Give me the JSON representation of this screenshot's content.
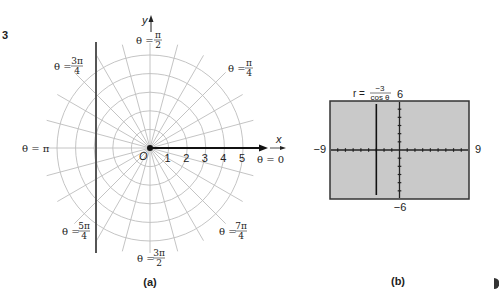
{
  "problem_number": "3",
  "panel_a": {
    "caption": "(a)",
    "axis_labels": {
      "x": "x",
      "y": "y",
      "origin": "O"
    },
    "radial_ticks": [
      "1",
      "2",
      "3",
      "4",
      "5"
    ],
    "angle_labels": {
      "zero": "θ = 0",
      "pi_over_4": {
        "prefix": "θ =",
        "num": "π",
        "den": "4"
      },
      "pi_over_2": {
        "prefix": "θ =",
        "num": "π",
        "den": "2"
      },
      "three_pi_over_4": {
        "prefix": "θ =",
        "num": "3π",
        "den": "4"
      },
      "pi": "θ = π",
      "five_pi_over_4": {
        "prefix": "θ =",
        "num": "5π",
        "den": "4"
      },
      "three_pi_over_2": {
        "prefix": "θ =",
        "num": "3π",
        "den": "2"
      },
      "seven_pi_over_4": {
        "prefix": "θ =",
        "num": "7π",
        "den": "4"
      }
    },
    "graph": {
      "equation": "r cos θ = -3",
      "line_x": -3
    }
  },
  "panel_b": {
    "caption": "(b)",
    "equation": {
      "lhs": "r =",
      "num": "−3",
      "den": "cos θ"
    },
    "window": {
      "xmin": "−9",
      "xmax": "9",
      "ymin": "−6",
      "ymax": "6"
    },
    "screen_color": "#c9c9c9"
  },
  "chart_data": [
    {
      "type": "polar",
      "title": "(a)",
      "rings": [
        1,
        2,
        3,
        4,
        5
      ],
      "spoke_step_degrees": 15,
      "series": [
        {
          "name": "r = -3/cos θ",
          "kind": "vertical-line",
          "x": -3
        }
      ]
    },
    {
      "type": "line",
      "title": "(b)",
      "xlim": [
        -9,
        9
      ],
      "ylim": [
        -6,
        6
      ],
      "xtick_step": 1,
      "ytick_step": 1,
      "series": [
        {
          "name": "r = -3/cos θ",
          "kind": "vertical-line",
          "x": -3
        }
      ]
    }
  ]
}
